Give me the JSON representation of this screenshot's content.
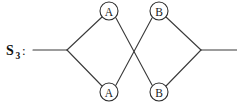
{
  "diagram": {
    "type": "butterfly-trellis",
    "width": 237,
    "height": 105,
    "background_color": "#ffffff",
    "line_color": "#3a3a3a",
    "text_color": "#111111"
  },
  "state_label": {
    "base": "S",
    "subscript": "3",
    "colon": ":",
    "full_text": "S3:"
  },
  "nodes": [
    {
      "id": "top-a",
      "label": "A",
      "cx": 109,
      "cy": 11,
      "r": 9
    },
    {
      "id": "top-b",
      "label": "B",
      "cx": 159,
      "cy": 11,
      "r": 9
    },
    {
      "id": "bottom-a",
      "label": "A",
      "cx": 109,
      "cy": 92,
      "r": 9
    },
    {
      "id": "bottom-b",
      "label": "B",
      "cx": 159,
      "cy": 92,
      "r": 9
    }
  ],
  "vertices": {
    "left": {
      "x": 67,
      "y": 50
    },
    "right": {
      "x": 201,
      "y": 50
    }
  },
  "edges": [
    {
      "id": "input-stub",
      "from": "left-edge",
      "to": "left-vertex",
      "d": "M 33 50 L 67 50"
    },
    {
      "id": "left-to-top-a",
      "from": "left-vertex",
      "to": "top-a",
      "d": "M 67 50 L 102 17"
    },
    {
      "id": "left-to-bottom-a",
      "from": "left-vertex",
      "to": "bottom-a",
      "d": "M 67 50 L 102 86"
    },
    {
      "id": "top-a-to-bottom-b",
      "from": "top-a",
      "to": "bottom-b",
      "d": "M 116 18 L 152 85"
    },
    {
      "id": "bottom-a-to-top-b",
      "from": "bottom-a",
      "to": "top-b",
      "d": "M 116 85 L 152 18"
    },
    {
      "id": "top-b-to-right",
      "from": "top-b",
      "to": "right-vertex",
      "d": "M 166 17 L 201 50"
    },
    {
      "id": "bottom-b-to-right",
      "from": "bottom-b",
      "to": "right-vertex",
      "d": "M 166 86 L 201 50"
    },
    {
      "id": "output-stub",
      "from": "right-vertex",
      "to": "right-edge",
      "d": "M 201 50 L 237 50"
    }
  ]
}
